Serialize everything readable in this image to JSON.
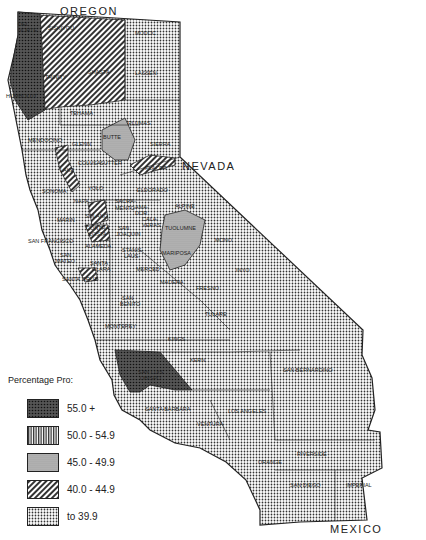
{
  "labels": {
    "oregon": "OREGON",
    "nevada": "NEVADA",
    "mexico": "MEXICO"
  },
  "legend": {
    "title": "Percentage Pro:",
    "items": [
      {
        "label": "55.0 +",
        "pattern": "dense-dark"
      },
      {
        "label": "50.0 - 54.9",
        "pattern": "vertical-lines"
      },
      {
        "label": "45.0 - 49.9",
        "pattern": "fine-gray"
      },
      {
        "label": "40.0 - 44.9",
        "pattern": "diagonal-lines"
      },
      {
        "label": "to  39.9",
        "pattern": "dots"
      }
    ]
  },
  "counties": [
    {
      "name": "DEL NORTE",
      "class": "55.0 +"
    },
    {
      "name": "SISKIYOU",
      "class": "40.0 - 44.9"
    },
    {
      "name": "MODOC",
      "class": "to 39.9"
    },
    {
      "name": "HUMBOLDT",
      "class": "55.0 +"
    },
    {
      "name": "TRINITY",
      "class": "40.0 - 44.9"
    },
    {
      "name": "SHASTA",
      "class": "40.0 - 44.9"
    },
    {
      "name": "LASSEN",
      "class": "to 39.9"
    },
    {
      "name": "TEHAMA",
      "class": "to 39.9"
    },
    {
      "name": "PLUMAS",
      "class": "to 39.9"
    },
    {
      "name": "BUTTE",
      "class": "45.0 - 49.9"
    },
    {
      "name": "MENDOCINO",
      "class": "to 39.9"
    },
    {
      "name": "GLENN",
      "class": "to 39.9"
    },
    {
      "name": "SIERRA",
      "class": "to 39.9"
    },
    {
      "name": "COLUSA",
      "class": "to 39.9"
    },
    {
      "name": "SUTTER",
      "class": "to 39.9"
    },
    {
      "name": "YUBA",
      "class": "to 39.9"
    },
    {
      "name": "NEVADA",
      "class": "40.0 - 44.9"
    },
    {
      "name": "PLACER",
      "class": "to 39.9"
    },
    {
      "name": "LAKE",
      "class": "40.0 - 44.9"
    },
    {
      "name": "SONOMA",
      "class": "to 39.9"
    },
    {
      "name": "YOLO",
      "class": "to 39.9"
    },
    {
      "name": "ELDORADO",
      "class": "to 39.9"
    },
    {
      "name": "NAPA",
      "class": "to 39.9"
    },
    {
      "name": "SACRAMENTO",
      "class": "to 39.9"
    },
    {
      "name": "AMADOR",
      "class": "to 39.9"
    },
    {
      "name": "ALPINE",
      "class": "to 39.9"
    },
    {
      "name": "SOLANO",
      "class": "40.0 - 44.9"
    },
    {
      "name": "CALAVERAS",
      "class": "to 39.9"
    },
    {
      "name": "TUOLUMNE",
      "class": "45.0 - 49.9"
    },
    {
      "name": "MARIN",
      "class": "to 39.9"
    },
    {
      "name": "CONTRA COSTA",
      "class": "40.0 - 44.9"
    },
    {
      "name": "SAN JOAQUIN",
      "class": "to 39.9"
    },
    {
      "name": "MONO",
      "class": "to 39.9"
    },
    {
      "name": "SAN FRANCISCO",
      "class": "to 39.9"
    },
    {
      "name": "ALAMEDA",
      "class": "to 39.9"
    },
    {
      "name": "SAN MATEO",
      "class": "to 39.9"
    },
    {
      "name": "STANISLAUS",
      "class": "to 39.9"
    },
    {
      "name": "MARIPOSA",
      "class": "45.0 - 49.9"
    },
    {
      "name": "SANTA CLARA",
      "class": "to 39.9"
    },
    {
      "name": "SANTA CRUZ",
      "class": "40.0 - 44.9"
    },
    {
      "name": "MERCED",
      "class": "to 39.9"
    },
    {
      "name": "MADERA",
      "class": "to 39.9"
    },
    {
      "name": "INYO",
      "class": "to 39.9"
    },
    {
      "name": "FRESNO",
      "class": "to 39.9"
    },
    {
      "name": "SAN BENITO",
      "class": "to 39.9"
    },
    {
      "name": "TULARE",
      "class": "to 39.9"
    },
    {
      "name": "MONTEREY",
      "class": "to 39.9"
    },
    {
      "name": "KINGS",
      "class": "to 39.9"
    },
    {
      "name": "KERN",
      "class": "to 39.9"
    },
    {
      "name": "SAN LUIS OBISPO",
      "class": "55.0 +"
    },
    {
      "name": "SAN BERNARDINO",
      "class": "to 39.9"
    },
    {
      "name": "SANTA BARBARA",
      "class": "to 39.9"
    },
    {
      "name": "VENTURA",
      "class": "to 39.9"
    },
    {
      "name": "LOS ANGELES",
      "class": "to 39.9"
    },
    {
      "name": "ORANGE",
      "class": "to 39.9"
    },
    {
      "name": "RIVERSIDE",
      "class": "to 39.9"
    },
    {
      "name": "SAN DIEGO",
      "class": "to 39.9"
    },
    {
      "name": "IMPERIAL",
      "class": "to 39.9"
    }
  ]
}
